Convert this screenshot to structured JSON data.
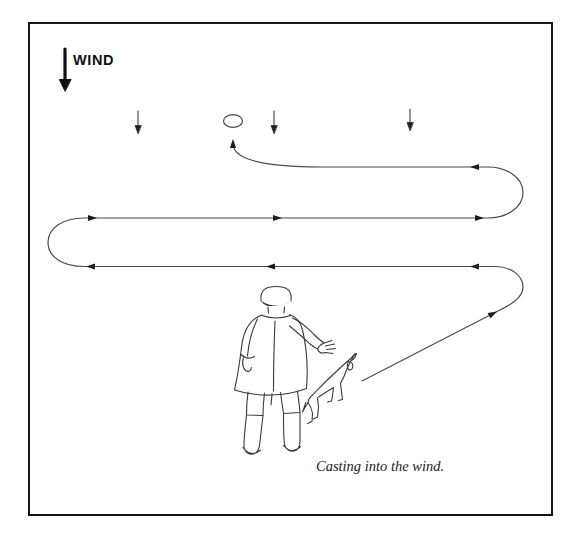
{
  "wind": {
    "label": "WIND",
    "direction": "down",
    "small_arrows": 3
  },
  "caption": {
    "text": "Casting into the wind."
  },
  "quartering_path": {
    "start": "dog",
    "finish": "oval-marker",
    "legs": [
      {
        "name": "initial-cast",
        "direction": "up-right"
      },
      {
        "name": "sweep-1",
        "direction": "left"
      },
      {
        "name": "sweep-2",
        "direction": "right"
      },
      {
        "name": "sweep-3",
        "direction": "left"
      },
      {
        "name": "final-turn",
        "direction": "up"
      }
    ]
  },
  "figures": {
    "handler": "person viewed from behind, right arm extended in casting gesture",
    "dog": "dog standing at handler's right side facing the cast line"
  },
  "colors": {
    "background": "#ffffff",
    "border": "#161616",
    "path_line": "#4a4a4a",
    "figure_line": "#3a3a3a",
    "arrow_fill": "#1c1c1c",
    "text": "#111111"
  }
}
